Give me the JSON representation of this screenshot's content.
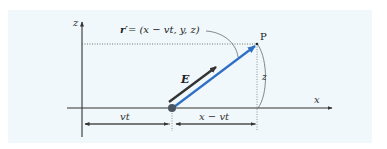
{
  "diagram": {
    "background_color": "#f1f8fb",
    "axes": {
      "x_label": "x",
      "z_label": "z",
      "axis_color": "#3a3a3a"
    },
    "point": {
      "label": "P"
    },
    "vectors": {
      "r_prime": {
        "label_lhs": "r′",
        "label_rhs": "= (x − vt, y, z)",
        "color": "#2f6fc4"
      },
      "E": {
        "label": "E",
        "color": "#333333"
      }
    },
    "charge": {
      "color": "#4a5560"
    },
    "dimensions": {
      "vt": "vt",
      "x_minus_vt": "x − vt",
      "z": "z"
    }
  }
}
